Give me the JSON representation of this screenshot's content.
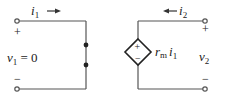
{
  "diagram": {
    "type": "two-port circuit",
    "colors": {
      "wire": "#555555",
      "text": "#222222",
      "background": "#ffffff"
    },
    "left_port": {
      "current_label": "i",
      "current_sub": "1",
      "current_direction": "right",
      "voltage_label": "v",
      "voltage_sub": "1",
      "voltage_value": " = 0",
      "plus": "+",
      "minus": "−",
      "element": "short circuit (wire with two nodes)"
    },
    "right_port": {
      "current_label": "i",
      "current_sub": "2",
      "current_direction": "left",
      "voltage_label": "v",
      "voltage_sub": "2",
      "plus": "+",
      "minus": "−",
      "source": {
        "type": "dependent voltage source (diamond)",
        "plus": "+",
        "minus": "−",
        "gain_symbol": "r",
        "gain_sub": "m",
        "control_var": "i",
        "control_sub": "1"
      }
    }
  }
}
